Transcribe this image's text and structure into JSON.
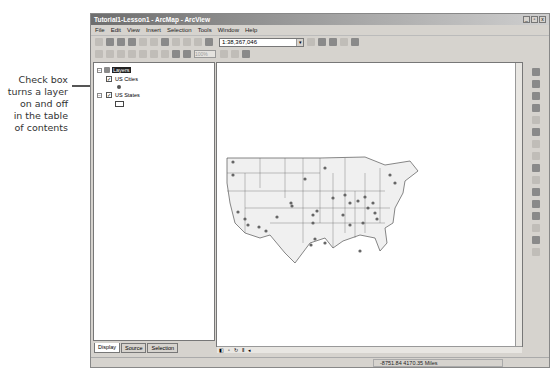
{
  "annotation": {
    "text_lines": [
      "Check box",
      "turns a layer",
      "on and off",
      "in the table",
      "of contents"
    ]
  },
  "window": {
    "title": "Tutorial1-Lesson1 - ArcMap - ArcView",
    "controls": [
      "_",
      "▫",
      "x"
    ]
  },
  "menu": {
    "items": [
      "File",
      "Edit",
      "View",
      "Insert",
      "Selection",
      "Tools",
      "Window",
      "Help"
    ]
  },
  "toolbar": {
    "scale_value": "1:38,367,046",
    "dropdown_glyph": "▾",
    "zoom_percent": "100%"
  },
  "toc": {
    "root_label": "Layers",
    "layers": [
      {
        "name": "US Cities",
        "checked": true,
        "symbol": "point"
      },
      {
        "name": "US States",
        "checked": true,
        "symbol": "polygon"
      }
    ],
    "check_glyph": "✓",
    "collapse_glyph": "−"
  },
  "tabs": [
    {
      "label": "Display",
      "active": true
    },
    {
      "label": "Source",
      "active": false
    },
    {
      "label": "Selection",
      "active": false
    }
  ],
  "map": {
    "nav_glyphs": [
      "◧",
      "▫",
      "↻",
      "Ⅱ",
      "◂"
    ]
  },
  "status": {
    "coordinates": "-8751.84  4170.35 Miles"
  },
  "colors": {
    "window_bg": "#d6d3ce",
    "title_bar": "#6e6e6e",
    "state_fill": "#f0f0f0",
    "state_stroke": "#555555",
    "city_dot": "#666666"
  }
}
